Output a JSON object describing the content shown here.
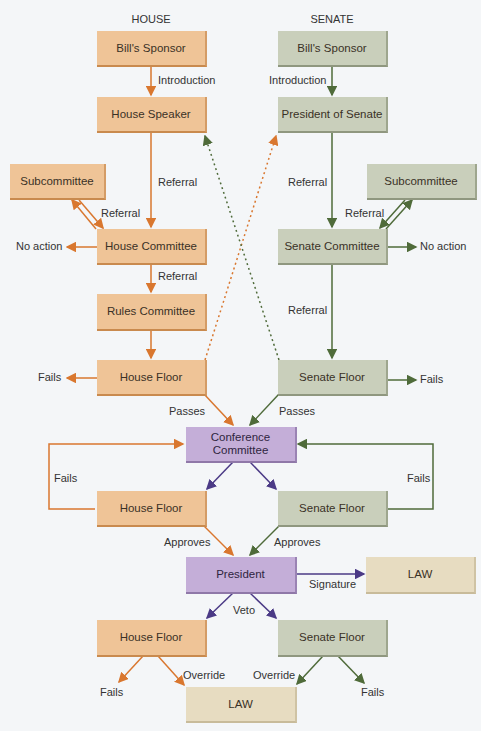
{
  "columns": {
    "house": "HOUSE",
    "senate": "SENATE"
  },
  "colors": {
    "house": "#efc497",
    "senate": "#c9cfbb",
    "conference": "#c4aed8",
    "law": "#e7dcc1",
    "house_arrow": "#d9772f",
    "senate_arrow": "#4f6b3a",
    "purple_arrow": "#4b3a86"
  },
  "house": {
    "sponsor": "Bill's Sponsor",
    "speaker": "House Speaker",
    "subcommittee": "Subcommittee",
    "committee": "House Committee",
    "rules": "Rules Committee",
    "floor": "House Floor"
  },
  "senate": {
    "sponsor": "Bill's Sponsor",
    "president": "President of Senate",
    "subcommittee": "Subcommittee",
    "committee": "Senate Committee",
    "floor": "Senate Floor"
  },
  "conference": "Conference Committee",
  "conference_floors": {
    "house": "House Floor",
    "senate": "Senate Floor"
  },
  "president": "President",
  "law_signature": "LAW",
  "veto_floors": {
    "house": "House Floor",
    "senate": "Senate Floor"
  },
  "law_override": "LAW",
  "labels": {
    "house_intro": "Introduction",
    "senate_intro": "Introduction",
    "house_referral_1": "Referral",
    "senate_referral_1": "Referral",
    "house_sub_referral": "Referral",
    "senate_sub_referral": "Referral",
    "house_no_action": "No action",
    "senate_no_action": "No action",
    "house_referral_2": "Referral",
    "senate_referral_2": "Referral",
    "house_fails": "Fails",
    "senate_fails": "Fails",
    "house_passes": "Passes",
    "senate_passes": "Passes",
    "conf_house_fails": "Fails",
    "conf_senate_fails": "Fails",
    "house_approves": "Approves",
    "senate_approves": "Approves",
    "signature": "Signature",
    "veto": "Veto",
    "house_override": "Override",
    "senate_override": "Override",
    "veto_house_fails": "Fails",
    "veto_senate_fails": "Fails"
  }
}
